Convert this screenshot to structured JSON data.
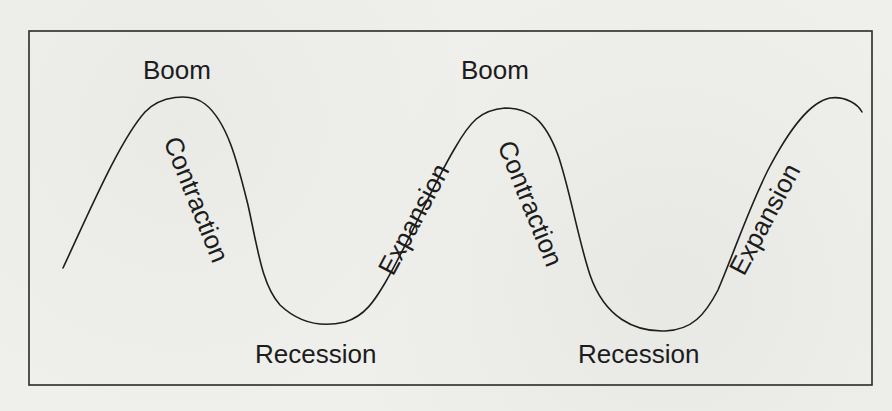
{
  "diagram": {
    "type": "business-cycle",
    "frame": {
      "x": 29,
      "y": 31,
      "width": 843,
      "height": 354,
      "stroke": "#2a2a2a"
    },
    "curve": {
      "stroke": "#1e1e1e",
      "path": "M63,268 C90,210 120,140 145,112 C160,96 190,92 205,104 C228,122 238,165 248,205 C258,250 262,285 280,305 C298,322 320,328 345,322 C365,316 375,300 385,283 C410,240 430,190 455,148 C470,122 480,110 505,108 C530,108 545,120 558,155 C570,190 577,235 590,275 C605,318 635,332 665,331 C692,330 705,315 718,290 C735,250 748,210 768,170 C790,128 810,102 830,98 C845,96 858,104 862,112"
    },
    "labels": [
      {
        "id": "boom-1",
        "text": "Boom",
        "x": 143,
        "y": 79,
        "rotate": 0
      },
      {
        "id": "contraction-1",
        "text": "Contraction",
        "x": 181,
        "y": 134,
        "rotate": 68
      },
      {
        "id": "recession-1",
        "text": "Recession",
        "x": 255,
        "y": 363,
        "rotate": 0
      },
      {
        "id": "expansion-1",
        "text": "Expansion",
        "x": 393,
        "y": 277,
        "rotate": -62
      },
      {
        "id": "boom-2",
        "text": "Boom",
        "x": 461,
        "y": 79,
        "rotate": 0
      },
      {
        "id": "contraction-2",
        "text": "Contraction",
        "x": 515,
        "y": 138,
        "rotate": 68
      },
      {
        "id": "recession-2",
        "text": "Recession",
        "x": 578,
        "y": 363,
        "rotate": 0
      },
      {
        "id": "expansion-2",
        "text": "Expansion",
        "x": 744,
        "y": 277,
        "rotate": -62
      }
    ]
  }
}
